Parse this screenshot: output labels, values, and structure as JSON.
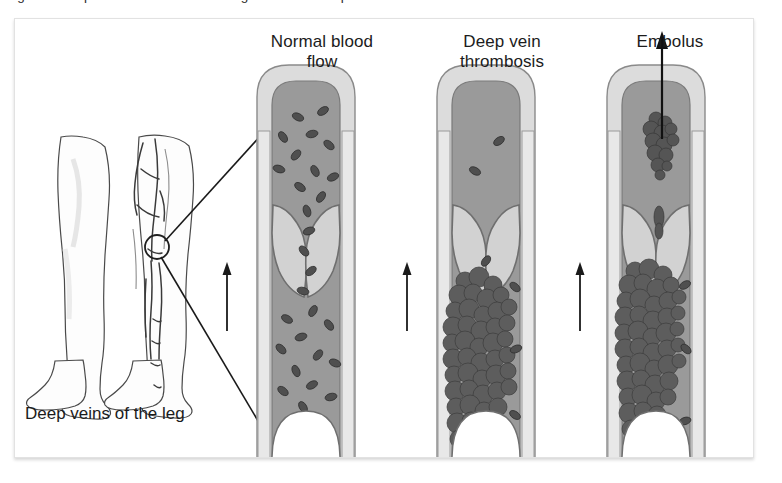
{
  "figure": {
    "caption": "Figure 1  Deep vein thrombosis in the leg and the development of an embolus.",
    "labels": {
      "normal_flow_line1": "Normal blood",
      "normal_flow_line2": "flow",
      "dvt_line1": "Deep vein",
      "dvt_line2": "thrombosis",
      "embolus": "Embolus",
      "leg_veins": "Deep veins of the leg"
    },
    "panels": [
      {
        "id": "normal-blood-flow",
        "title": "Normal blood flow",
        "vessel": "deep vein",
        "valve_state": "open",
        "thrombus": "none",
        "red_blood_cells": "abundant",
        "flow_direction": "upward"
      },
      {
        "id": "deep-vein-thrombosis",
        "title": "Deep vein thrombosis",
        "vessel": "deep vein",
        "valve_state": "open",
        "thrombus": "large adherent clot at valve pocket",
        "red_blood_cells": "sparse",
        "flow_direction": "upward"
      },
      {
        "id": "embolus",
        "title": "Embolus",
        "vessel": "deep vein",
        "valve_state": "open",
        "thrombus": "residual clot with detached fragment travelling upward",
        "red_blood_cells": "sparse",
        "flow_direction": "upward"
      }
    ],
    "anatomy": {
      "left_leg": "leg outline, anterior view",
      "right_leg": "leg with deep venous network",
      "marker": "circle indicating popliteal vein sample site"
    },
    "colors": {
      "vessel_wall": "#dcdcdc",
      "vessel_wall_line": "#7c7c7c",
      "lumen": "#9a9a9a",
      "valve_leaflet": "#cfcfcf",
      "red_blood_cell": "#4a4a4a",
      "thrombus": "#5d5d5d",
      "arrow": "#1a1a1a",
      "panel_border": "#e2e2e2",
      "text": "#1c1c1c"
    }
  }
}
